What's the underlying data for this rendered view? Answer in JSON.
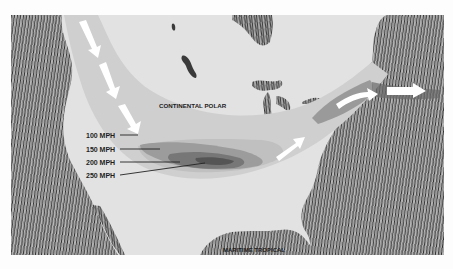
{
  "map": {
    "subject": "Jet stream over North America",
    "regions": {
      "north_label": "CONTINENTAL POLAR",
      "south_label": "MARITIME TROPICAL"
    },
    "legend": [
      {
        "label": "100 MPH",
        "shade": "#c2c2c2"
      },
      {
        "label": "150 MPH",
        "shade": "#9e9e9e"
      },
      {
        "label": "200 MPH",
        "shade": "#7a7a7a"
      },
      {
        "label": "250 MPH",
        "shade": "#5a5a5a"
      }
    ],
    "colors": {
      "background": "#fdfdfd",
      "land": "#e2e2e2",
      "ocean_texture_dark": "#3a3a3a",
      "ocean_texture_light": "#bdbdbd",
      "jet_band": "#cdcdcd",
      "arrow": "#ffffff"
    },
    "flow_direction": "west-to-east arrows"
  }
}
